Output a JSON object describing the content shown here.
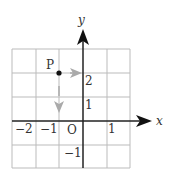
{
  "diagram": {
    "type": "coordinate-plane",
    "axes": {
      "x_label": "x",
      "y_label": "y",
      "origin_label": "O",
      "x_ticks": [
        {
          "value": -2,
          "label": "−2"
        },
        {
          "value": -1,
          "label": "−1"
        },
        {
          "value": 1,
          "label": "1"
        }
      ],
      "y_ticks": [
        {
          "value": 2,
          "label": "2"
        },
        {
          "value": 1,
          "label": "1"
        },
        {
          "value": -1,
          "label": "−1"
        }
      ],
      "grid_range": {
        "x": [
          -3,
          2
        ],
        "y": [
          -2,
          3
        ]
      }
    },
    "point": {
      "label": "P",
      "x": -1,
      "y": 2
    },
    "arrows": [
      {
        "name": "horizontal-move",
        "from": [
          -0.5,
          2
        ],
        "to": [
          0,
          2
        ],
        "color": "#aaaaaa"
      },
      {
        "name": "vertical-move",
        "from": [
          -1,
          1.7
        ],
        "to": [
          -1,
          1
        ],
        "color": "#aaaaaa"
      }
    ],
    "colors": {
      "grid": "#bbbbbb",
      "axis": "#222222",
      "arrow": "#aaaaaa",
      "point": "#111111"
    }
  }
}
